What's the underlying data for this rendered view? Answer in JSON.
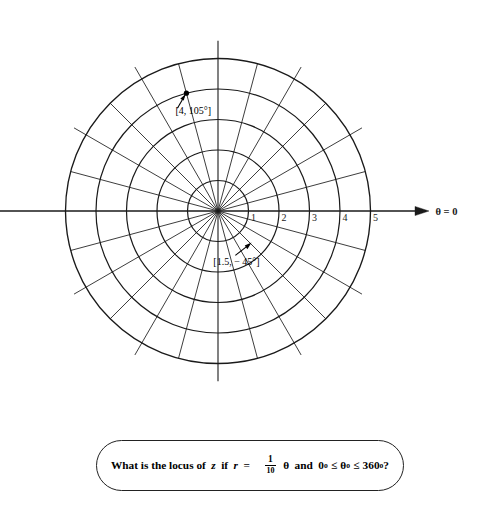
{
  "figure": {
    "type": "polar-grid-diagram",
    "background": "#ffffff",
    "stroke": "#1a1a1a",
    "center": {
      "x": 218,
      "y": 211
    },
    "unit_px": 30.5,
    "axis_label": "θ = 0",
    "axis_arrow_name": "theta-zero-arrow",
    "circles": [
      1,
      2,
      3,
      4,
      5
    ],
    "spoke_step_degrees": 15,
    "spoke_count": 24,
    "radial_tick_labels": [
      "1",
      "2",
      "3",
      "4",
      "5"
    ],
    "points": [
      {
        "name": "point-4-105",
        "label": "[4, 105°]",
        "r": 4,
        "theta_deg": 105
      },
      {
        "name": "point-1p5-minus45",
        "label": "[1.5, − 45°]",
        "r": 1.5,
        "theta_deg": -45
      }
    ]
  },
  "caption": {
    "t1": "What is the locus of",
    "var_z": "z",
    "t2": "if",
    "var_r": "r",
    "eq": "=",
    "frac_num": "1",
    "frac_den": "10",
    "theta": "θ",
    "t3": "and",
    "zero": "0",
    "deg1": "o",
    "le1": "≤",
    "theta2": "θ",
    "deg2": "o",
    "le2": "≤",
    "threesixty": "360",
    "deg3": "o",
    "qmark": "?"
  },
  "chart_data": {
    "type": "scatter",
    "title": "",
    "xlabel": "",
    "ylabel": "",
    "coordinate_system": "polar",
    "r_ticks": [
      1,
      2,
      3,
      4,
      5
    ],
    "r_range": [
      0,
      5
    ],
    "theta_ticks_deg": [
      0,
      15,
      30,
      45,
      60,
      75,
      90,
      105,
      120,
      135,
      150,
      165,
      180,
      195,
      210,
      225,
      240,
      255,
      270,
      285,
      300,
      315,
      330,
      345
    ],
    "grid": true,
    "legend": "none",
    "annotations": [
      {
        "text": "[4, 105°]",
        "r": 4,
        "theta_deg": 105
      },
      {
        "text": "[1.5, − 45°]",
        "r": 1.5,
        "theta_deg": -45
      }
    ],
    "points": [
      {
        "r": 4,
        "theta_deg": 105
      },
      {
        "r": 1.5,
        "theta_deg": -45
      }
    ]
  }
}
